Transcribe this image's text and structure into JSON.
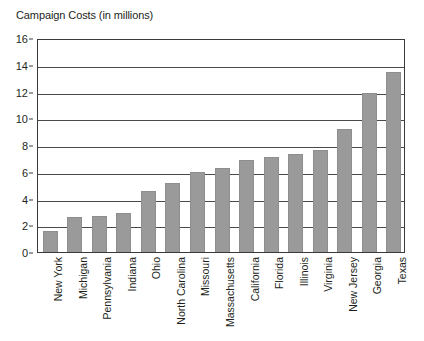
{
  "chart_data": {
    "type": "bar",
    "title": "Campaign Costs (in millions)",
    "xlabel": "",
    "ylabel": "",
    "ylim": [
      0,
      16
    ],
    "yticks": [
      0,
      2,
      4,
      6,
      8,
      10,
      12,
      14,
      16
    ],
    "grid": true,
    "legend": false,
    "orientation": "vertical",
    "bar_color": "#9a9a9a",
    "categories": [
      "New York",
      "Michigan",
      "Pennsylvania",
      "Indiana",
      "Ohio",
      "North Carolina",
      "Missouri",
      "Massachusetts",
      "California",
      "Florida",
      "Illinois",
      "Virginia",
      "New Jersey",
      "Georgia",
      "Texas"
    ],
    "values": [
      1.6,
      2.6,
      2.7,
      2.95,
      4.55,
      5.15,
      6.0,
      6.25,
      6.9,
      7.1,
      7.3,
      7.6,
      9.2,
      11.9,
      13.45
    ]
  }
}
